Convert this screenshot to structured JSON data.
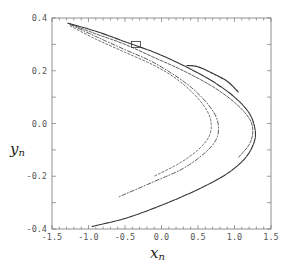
{
  "chart_data": {
    "type": "scatter",
    "title": "",
    "xlabel": "x_n",
    "ylabel": "y_n",
    "xlabel_main": "x",
    "xlabel_sub": "n",
    "ylabel_main": "y",
    "ylabel_sub": "n",
    "xlim": [
      -1.5,
      1.5
    ],
    "ylim": [
      -0.4,
      0.4
    ],
    "grid": false,
    "legend": null,
    "x_ticks": [
      "-1.5",
      "-1.0",
      "-0.5",
      "0.0",
      "0.5",
      "1.0",
      "1.5"
    ],
    "y_ticks": [
      "-0.4",
      "-0.2",
      "0.0",
      "0.2",
      "0.4"
    ],
    "series": [
      {
        "name": "outer-branch",
        "points": [
          [
            -1.28,
            0.38
          ],
          [
            -0.9,
            0.35
          ],
          [
            -0.5,
            0.31
          ],
          [
            -0.1,
            0.27
          ],
          [
            0.3,
            0.22
          ],
          [
            0.7,
            0.16
          ],
          [
            1.0,
            0.1
          ],
          [
            1.2,
            0.04
          ],
          [
            1.28,
            -0.02
          ],
          [
            1.27,
            -0.07
          ],
          [
            1.15,
            -0.13
          ],
          [
            0.9,
            -0.19
          ],
          [
            0.5,
            -0.25
          ],
          [
            0.0,
            -0.31
          ],
          [
            -0.5,
            -0.36
          ],
          [
            -0.95,
            -0.39
          ]
        ]
      },
      {
        "name": "second-branch",
        "points": [
          [
            -1.28,
            0.38
          ],
          [
            -0.9,
            0.34
          ],
          [
            -0.5,
            0.3
          ],
          [
            -0.1,
            0.25
          ],
          [
            0.3,
            0.2
          ],
          [
            0.7,
            0.14
          ],
          [
            1.0,
            0.08
          ],
          [
            1.2,
            0.02
          ],
          [
            1.25,
            -0.03
          ],
          [
            1.2,
            -0.08
          ],
          [
            1.05,
            -0.13
          ]
        ]
      },
      {
        "name": "inner-branch-1",
        "points": [
          [
            -1.25,
            0.375
          ],
          [
            -0.9,
            0.33
          ],
          [
            -0.5,
            0.28
          ],
          [
            -0.1,
            0.23
          ],
          [
            0.3,
            0.16
          ],
          [
            0.55,
            0.1
          ],
          [
            0.72,
            0.04
          ],
          [
            0.78,
            -0.01
          ],
          [
            0.75,
            -0.06
          ],
          [
            0.6,
            -0.11
          ],
          [
            0.3,
            -0.17
          ],
          [
            -0.1,
            -0.22
          ],
          [
            -0.6,
            -0.28
          ]
        ]
      },
      {
        "name": "inner-branch-2",
        "points": [
          [
            -1.25,
            0.37
          ],
          [
            -0.9,
            0.32
          ],
          [
            -0.5,
            0.27
          ],
          [
            -0.1,
            0.22
          ],
          [
            0.2,
            0.17
          ],
          [
            0.45,
            0.11
          ],
          [
            0.62,
            0.05
          ],
          [
            0.68,
            0.0
          ],
          [
            0.65,
            -0.05
          ],
          [
            0.5,
            -0.1
          ],
          [
            0.25,
            -0.15
          ],
          [
            -0.1,
            -0.2
          ]
        ]
      },
      {
        "name": "inner-loop",
        "points": [
          [
            0.35,
            0.22
          ],
          [
            0.5,
            0.215
          ],
          [
            0.7,
            0.19
          ],
          [
            0.9,
            0.16
          ],
          [
            1.05,
            0.12
          ]
        ]
      }
    ],
    "annotations": [
      {
        "type": "box",
        "x": -0.35,
        "y": 0.3,
        "label": "zoom region"
      }
    ]
  },
  "colors": {
    "axis": "#777777",
    "data": "#333333",
    "text": "#555555"
  }
}
